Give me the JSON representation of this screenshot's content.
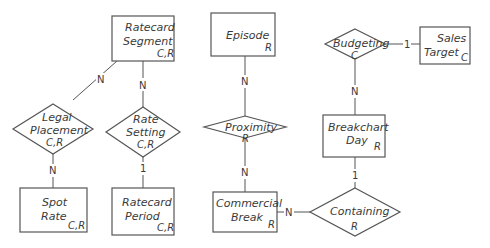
{
  "diagram": {
    "type": "entity-relationship",
    "entities": [
      {
        "id": "ratecard_segment",
        "line1": "Ratecard",
        "line2": "Segment",
        "ops": "C,R"
      },
      {
        "id": "episode",
        "line1": "Episode",
        "line2": "",
        "ops": "R"
      },
      {
        "id": "sales_target",
        "line1": "Sales",
        "line2": "Target",
        "ops": "C"
      },
      {
        "id": "breakchart_day",
        "line1": "Breakchart",
        "line2": "Day",
        "ops": "R"
      },
      {
        "id": "spot_rate",
        "line1": "Spot",
        "line2": "Rate",
        "ops": "C,R"
      },
      {
        "id": "ratecard_period",
        "line1": "Ratecard",
        "line2": "Period",
        "ops": "C,R"
      },
      {
        "id": "commercial_break",
        "line1": "Commercial",
        "line2": "Break",
        "ops": "R"
      }
    ],
    "relationships": [
      {
        "id": "legal_placement",
        "line1": "Legal",
        "line2": "Placement",
        "ops": "C,R"
      },
      {
        "id": "rate_setting",
        "line1": "Rate",
        "line2": "Setting",
        "ops": "C,R"
      },
      {
        "id": "proximity",
        "line1": "Proximity",
        "line2": "",
        "ops": "R"
      },
      {
        "id": "budgeting",
        "line1": "Budgeting",
        "line2": "",
        "ops": "C"
      },
      {
        "id": "containing",
        "line1": "Containing",
        "line2": "",
        "ops": "R"
      }
    ],
    "connections": [
      {
        "from": "ratecard_segment",
        "to": "legal_placement",
        "cardinality": "N"
      },
      {
        "from": "ratecard_segment",
        "to": "rate_setting",
        "cardinality": "N"
      },
      {
        "from": "legal_placement",
        "to": "spot_rate",
        "cardinality": "N"
      },
      {
        "from": "rate_setting",
        "to": "ratecard_period",
        "cardinality": "1"
      },
      {
        "from": "episode",
        "to": "proximity",
        "cardinality": "N"
      },
      {
        "from": "proximity",
        "to": "commercial_break",
        "cardinality": "N"
      },
      {
        "from": "budgeting",
        "to": "sales_target",
        "cardinality": "1"
      },
      {
        "from": "budgeting",
        "to": "breakchart_day",
        "cardinality": "N"
      },
      {
        "from": "breakchart_day",
        "to": "containing",
        "cardinality": "1"
      },
      {
        "from": "commercial_break",
        "to": "containing",
        "cardinality": "N"
      }
    ]
  }
}
